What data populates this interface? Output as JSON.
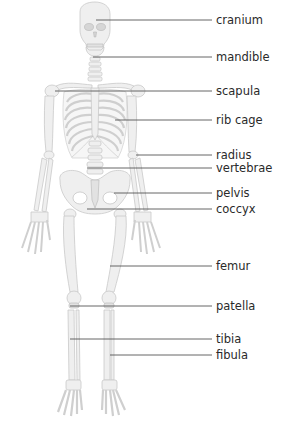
{
  "diagram": {
    "labels": [
      {
        "id": "cranium",
        "text": "cranium",
        "y": 20,
        "line_x1": 96
      },
      {
        "id": "mandible",
        "text": "mandible",
        "y": 57,
        "line_x1": 93
      },
      {
        "id": "scapula",
        "text": "scapula",
        "y": 91,
        "line_x1": 55
      },
      {
        "id": "rib-cage",
        "text": "rib cage",
        "y": 120,
        "line_x1": 115
      },
      {
        "id": "radius",
        "text": "radius",
        "y": 155,
        "line_x1": 136
      },
      {
        "id": "vertebrae",
        "text": "vertebrae",
        "y": 168,
        "line_x1": 87
      },
      {
        "id": "pelvis",
        "text": "pelvis",
        "y": 193,
        "line_x1": 114
      },
      {
        "id": "coccyx",
        "text": "coccyx",
        "y": 209,
        "line_x1": 87
      },
      {
        "id": "femur",
        "text": "femur",
        "y": 266,
        "line_x1": 110
      },
      {
        "id": "patella",
        "text": "patella",
        "y": 306,
        "line_x1": 70
      },
      {
        "id": "tibia",
        "text": "tibia",
        "y": 339,
        "line_x1": 70
      },
      {
        "id": "fibula",
        "text": "fibula",
        "y": 355,
        "line_x1": 110
      }
    ],
    "line_x2": 212,
    "text_x": 216,
    "colors": {
      "background": "#ffffff",
      "bone_fill": "#efefef",
      "bone_stroke": "#c9c9c9",
      "leader_line": "#555555",
      "label_text": "#2a2a2a"
    }
  }
}
